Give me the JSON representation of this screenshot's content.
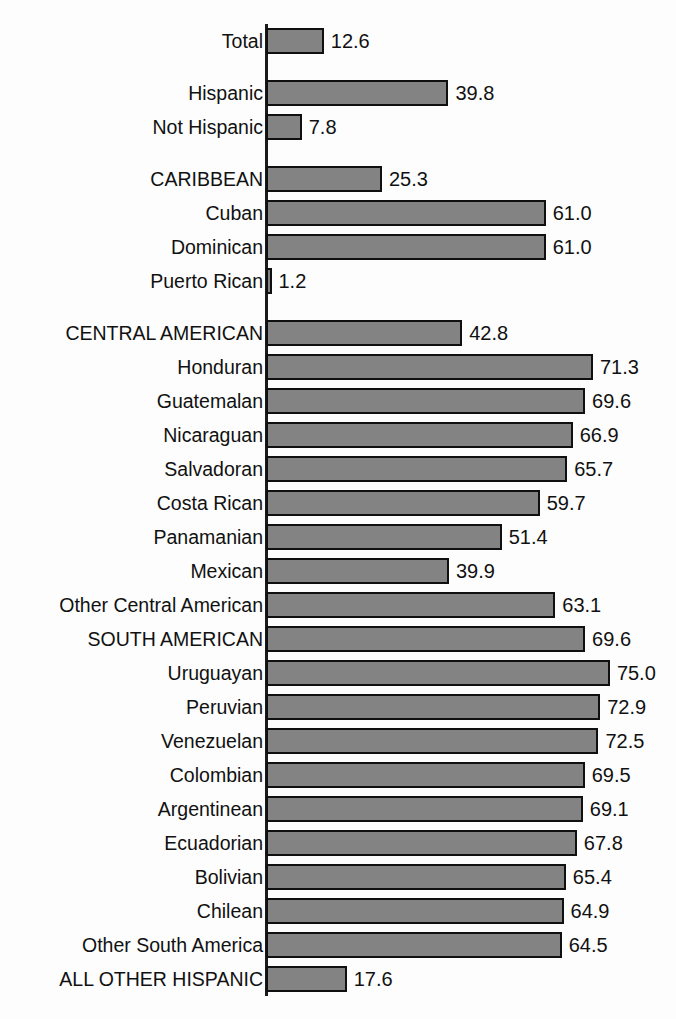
{
  "chart_data": {
    "type": "bar",
    "orientation": "horizontal",
    "title": "",
    "subtitle": "",
    "xlabel": "",
    "ylabel": "",
    "xlim": [
      0,
      80
    ],
    "grid": false,
    "legend": null,
    "bar_color": "#838383",
    "bar_border_color": "#101010",
    "background_color": "#fdfdfd",
    "axis_color": "#1b1b1b",
    "value_label_format": "one-decimal",
    "categories": [
      "Total",
      "Hispanic",
      "Not Hispanic",
      "CARIBBEAN",
      "Cuban",
      "Dominican",
      "Puerto Rican",
      "CENTRAL AMERICAN",
      "Honduran",
      "Guatemalan",
      "Nicaraguan",
      "Salvadoran",
      "Costa Rican",
      "Panamanian",
      "Mexican",
      "Other Central American",
      "SOUTH AMERICAN",
      "Uruguayan",
      "Peruvian",
      "Venezuelan",
      "Colombian",
      "Argentinean",
      "Ecuadorian",
      "Bolivian",
      "Chilean",
      "Other South America",
      "ALL OTHER HISPANIC"
    ],
    "values": [
      12.6,
      39.8,
      7.8,
      25.3,
      61.0,
      61.0,
      1.2,
      42.8,
      71.3,
      69.6,
      66.9,
      65.7,
      59.7,
      51.4,
      39.9,
      63.1,
      69.6,
      75.0,
      72.9,
      72.5,
      69.5,
      69.1,
      67.8,
      65.4,
      64.9,
      64.5,
      17.6
    ],
    "value_labels": [
      "12.6",
      "39.8",
      "7.8",
      "25.3",
      "61.0",
      "61.0",
      "1.2",
      "42.8",
      "71.3",
      "69.6",
      "66.9",
      "65.7",
      "59.7",
      "51.4",
      "39.9",
      "63.1",
      "69.6",
      "75.0",
      "72.9",
      "72.5",
      "69.5",
      "69.1",
      "67.8",
      "65.4",
      "64.9",
      "64.5",
      "17.6"
    ],
    "group_breaks_after": [
      0,
      2,
      6
    ],
    "bars": [
      {
        "label": "Total",
        "value": 12.6,
        "value_label": "12.6",
        "gap_before": 0
      },
      {
        "label": "Hispanic",
        "value": 39.8,
        "value_label": "39.8",
        "gap_before": 1
      },
      {
        "label": "Not Hispanic",
        "value": 7.8,
        "value_label": "7.8",
        "gap_before": 0
      },
      {
        "label": "CARIBBEAN",
        "value": 25.3,
        "value_label": "25.3",
        "gap_before": 1
      },
      {
        "label": "Cuban",
        "value": 61.0,
        "value_label": "61.0",
        "gap_before": 0
      },
      {
        "label": "Dominican",
        "value": 61.0,
        "value_label": "61.0",
        "gap_before": 0
      },
      {
        "label": "Puerto Rican",
        "value": 1.2,
        "value_label": "1.2",
        "gap_before": 0
      },
      {
        "label": "CENTRAL AMERICAN",
        "value": 42.8,
        "value_label": "42.8",
        "gap_before": 1
      },
      {
        "label": "Honduran",
        "value": 71.3,
        "value_label": "71.3",
        "gap_before": 0
      },
      {
        "label": "Guatemalan",
        "value": 69.6,
        "value_label": "69.6",
        "gap_before": 0
      },
      {
        "label": "Nicaraguan",
        "value": 66.9,
        "value_label": "66.9",
        "gap_before": 0
      },
      {
        "label": "Salvadoran",
        "value": 65.7,
        "value_label": "65.7",
        "gap_before": 0
      },
      {
        "label": "Costa Rican",
        "value": 59.7,
        "value_label": "59.7",
        "gap_before": 0
      },
      {
        "label": "Panamanian",
        "value": 51.4,
        "value_label": "51.4",
        "gap_before": 0
      },
      {
        "label": "Mexican",
        "value": 39.9,
        "value_label": "39.9",
        "gap_before": 0
      },
      {
        "label": "Other Central American",
        "value": 63.1,
        "value_label": "63.1",
        "gap_before": 0
      },
      {
        "label": "SOUTH AMERICAN",
        "value": 69.6,
        "value_label": "69.6",
        "gap_before": 0
      },
      {
        "label": "Uruguayan",
        "value": 75.0,
        "value_label": "75.0",
        "gap_before": 0
      },
      {
        "label": "Peruvian",
        "value": 72.9,
        "value_label": "72.9",
        "gap_before": 0
      },
      {
        "label": "Venezuelan",
        "value": 72.5,
        "value_label": "72.5",
        "gap_before": 0
      },
      {
        "label": "Colombian",
        "value": 69.5,
        "value_label": "69.5",
        "gap_before": 0
      },
      {
        "label": "Argentinean",
        "value": 69.1,
        "value_label": "69.1",
        "gap_before": 0
      },
      {
        "label": "Ecuadorian",
        "value": 67.8,
        "value_label": "67.8",
        "gap_before": 0
      },
      {
        "label": "Bolivian",
        "value": 65.4,
        "value_label": "65.4",
        "gap_before": 0
      },
      {
        "label": "Chilean",
        "value": 64.9,
        "value_label": "64.9",
        "gap_before": 0
      },
      {
        "label": "Other South America",
        "value": 64.5,
        "value_label": "64.5",
        "gap_before": 0
      },
      {
        "label": "ALL OTHER HISPANIC",
        "value": 17.6,
        "value_label": "17.6",
        "gap_before": 0
      }
    ]
  }
}
